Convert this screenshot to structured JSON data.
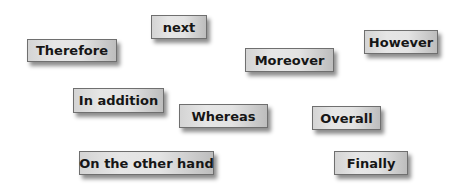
{
  "cards": [
    {
      "id": "therefore",
      "label": "Therefore",
      "x": 27,
      "y": 39,
      "w": 90,
      "h": 23
    },
    {
      "id": "next",
      "label": "next",
      "x": 151,
      "y": 15,
      "w": 56,
      "h": 24
    },
    {
      "id": "moreover",
      "label": "Moreover",
      "x": 245,
      "y": 48,
      "w": 89,
      "h": 24
    },
    {
      "id": "however",
      "label": "However",
      "x": 364,
      "y": 30,
      "w": 74,
      "h": 24
    },
    {
      "id": "in-addition",
      "label": "In addition",
      "x": 73,
      "y": 88,
      "w": 91,
      "h": 25
    },
    {
      "id": "whereas",
      "label": "Whereas",
      "x": 179,
      "y": 104,
      "w": 89,
      "h": 24
    },
    {
      "id": "overall",
      "label": "Overall",
      "x": 312,
      "y": 106,
      "w": 69,
      "h": 24
    },
    {
      "id": "on-the-other-hand",
      "label": "On the other hand",
      "x": 79,
      "y": 151,
      "w": 135,
      "h": 24
    },
    {
      "id": "finally",
      "label": "Finally",
      "x": 334,
      "y": 151,
      "w": 74,
      "h": 24
    }
  ]
}
